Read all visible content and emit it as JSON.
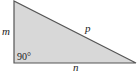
{
  "diagram": {
    "type": "right-triangle",
    "fill_color": "#d8d8d8",
    "stroke_color": "#555555",
    "vertices": {
      "top": [
        14,
        1
      ],
      "right_angle": [
        14,
        63
      ],
      "right": [
        136,
        63
      ]
    },
    "labels": {
      "vertical_side": "m",
      "hypotenuse": "p",
      "horizontal_side": "n",
      "right_angle": "90°"
    }
  }
}
